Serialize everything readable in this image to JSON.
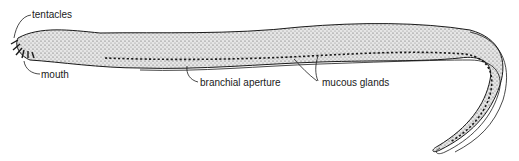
{
  "figure": {
    "labels": {
      "tentacles": "tentacles",
      "mouth": "mouth",
      "branchial_aperture": "branchial aperture",
      "mucous_glands": "mucous glands"
    },
    "colors": {
      "ink": "#1a1a1a",
      "stipple": "#9a9a9a",
      "background": "#ffffff"
    }
  }
}
